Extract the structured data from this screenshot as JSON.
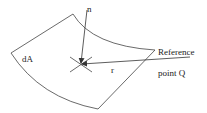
{
  "diagram": {
    "type": "surface-element-normal-vector",
    "labels": {
      "normal": "n",
      "area_element": "dA",
      "distance": "r",
      "reference_line1": "Reference",
      "reference_line2": "point Q"
    },
    "colors": {
      "stroke": "#333333",
      "text": "#222222",
      "background": "#ffffff"
    }
  }
}
